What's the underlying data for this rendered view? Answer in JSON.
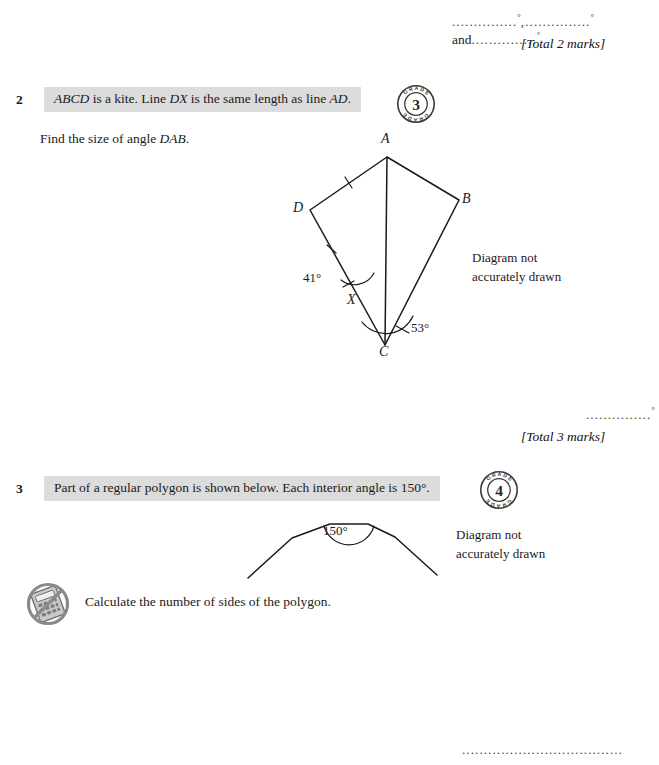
{
  "page": {
    "width": 659,
    "height": 765,
    "background": "#ffffff",
    "band_color": "#dcdcdc",
    "ink_color": "#1a1a1a"
  },
  "top_answer": {
    "dots1": "...............",
    "dots2": "...............",
    "dots3": "...............",
    "degree": "°",
    "and_label": "and",
    "total": "[Total 2 marks]"
  },
  "question2": {
    "number": "2",
    "stem_part1": "ABCD",
    "stem_part2": " is a kite.  Line ",
    "stem_part3": "DX",
    "stem_part4": " is the same length as line ",
    "stem_part5": "AD",
    "stem_part6": ".",
    "instruction_prefix": "Find the size of angle ",
    "instruction_italic": "DAB",
    "instruction_suffix": ".",
    "grade_badge": {
      "value": "3",
      "arc_text_top": "GRADE",
      "arc_text_bottom": "GRADE"
    },
    "diagram": {
      "note_line1": "Diagram not",
      "note_line2": "accurately drawn",
      "vertices": [
        {
          "label": "A",
          "x": 387,
          "y": 157
        },
        {
          "label": "B",
          "x": 459,
          "y": 200
        },
        {
          "label": "C",
          "x": 385,
          "y": 345
        },
        {
          "label": "D",
          "x": 310,
          "y": 210
        },
        {
          "label": "X",
          "x": 355,
          "y": 298
        }
      ],
      "angles": [
        {
          "label": "41°",
          "at": "X"
        },
        {
          "label": "53°",
          "at": "C"
        }
      ],
      "tick_marks": [
        "AD",
        "DX"
      ]
    },
    "answer": {
      "dots": "...............",
      "degree": "°",
      "total": "[Total 3 marks]"
    }
  },
  "question3": {
    "number": "3",
    "stem": "Part of a regular polygon is shown below.  Each interior angle is 150°.",
    "grade_badge": {
      "value": "4",
      "arc_text_top": "GRADE",
      "arc_text_bottom": "GRADE"
    },
    "diagram": {
      "interior_angle": "150°",
      "note_line1": "Diagram not",
      "note_line2": "accurately drawn"
    },
    "no_calculator_icon": "no-calculator",
    "instruction": "Calculate the number of sides of the polygon.",
    "answer": {
      "dots": "....................................."
    }
  }
}
